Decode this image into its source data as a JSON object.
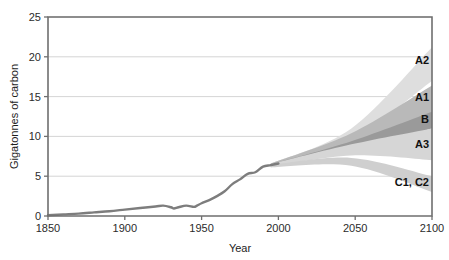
{
  "chart_data": {
    "type": "area",
    "title": "",
    "xlabel": "Year",
    "ylabel": "Gigatonnes of carbon",
    "xlim": [
      1850,
      2100
    ],
    "ylim": [
      0,
      25
    ],
    "grid": true,
    "legend_position": "inline-right",
    "x_ticks": [
      1850,
      1900,
      1950,
      2000,
      2050,
      2100
    ],
    "x_tick_labels": [
      "1850",
      "1900",
      "1950",
      "2000",
      "2050",
      "2100"
    ],
    "y_ticks": [
      0,
      5,
      10,
      15,
      20,
      25
    ],
    "y_tick_labels": [
      "0",
      "5",
      "10",
      "15",
      "20",
      "25"
    ],
    "historical": {
      "name": "Historical emissions",
      "color": "#7d7d7d",
      "x": [
        1850,
        1860,
        1870,
        1880,
        1890,
        1900,
        1910,
        1920,
        1925,
        1930,
        1932,
        1935,
        1940,
        1945,
        1947,
        1950,
        1955,
        1960,
        1965,
        1970,
        1975,
        1980,
        1985,
        1990,
        1995,
        2000
      ],
      "y": [
        0.1,
        0.2,
        0.3,
        0.45,
        0.6,
        0.8,
        1.0,
        1.2,
        1.3,
        1.1,
        0.95,
        1.1,
        1.3,
        1.15,
        1.3,
        1.6,
        2.0,
        2.5,
        3.1,
        4.0,
        4.6,
        5.3,
        5.5,
        6.2,
        6.4,
        6.6
      ]
    },
    "scenario_bands": [
      {
        "label": "A2",
        "color": "#dedede",
        "start_year": 1995,
        "start_low": 6.4,
        "start_high": 6.6,
        "end_year": 2100,
        "end_low": 17.0,
        "end_high": 21.2,
        "mid_low": 9.6,
        "mid_high": 11.0
      },
      {
        "label": "A1",
        "color": "#b9b9b9",
        "start_year": 1995,
        "start_low": 6.3,
        "start_high": 6.6,
        "end_year": 2100,
        "end_low": 12.1,
        "end_high": 16.4,
        "mid_low": 9.0,
        "mid_high": 10.4
      },
      {
        "label": "B",
        "color": "#9a9a9a",
        "start_year": 1995,
        "start_low": 6.2,
        "start_high": 6.5,
        "end_year": 2100,
        "end_low": 11.0,
        "end_high": 13.1,
        "mid_low": 8.2,
        "mid_high": 9.4
      },
      {
        "label": "A3",
        "color": "#d6d6d6",
        "start_year": 1995,
        "start_low": 6.2,
        "start_high": 6.5,
        "end_year": 2100,
        "end_low": 7.0,
        "end_high": 11.0,
        "mid_low": 7.6,
        "mid_high": 9.0
      },
      {
        "label": "C1, C2",
        "color": "#cfcfcf",
        "start_year": 1995,
        "start_low": 6.1,
        "start_high": 6.4,
        "end_year": 2100,
        "end_low": 3.0,
        "end_high": 5.0,
        "mid_low": 6.3,
        "mid_high": 7.3
      }
    ],
    "series_labels": [
      {
        "text": "A2",
        "year": 2100,
        "value": 19.6
      },
      {
        "text": "A1",
        "year": 2100,
        "value": 15.0
      },
      {
        "text": "B",
        "year": 2100,
        "value": 12.2
      },
      {
        "text": "A3",
        "year": 2100,
        "value": 9.0
      },
      {
        "text": "C1, C2",
        "year": 2100,
        "value": 4.3
      }
    ],
    "colors": {
      "axis": "#6f6f6f",
      "grid": "#c9c9c9",
      "text": "#1d1d1d",
      "background": "#ffffff",
      "historical_line": "#7d7d7d"
    }
  }
}
